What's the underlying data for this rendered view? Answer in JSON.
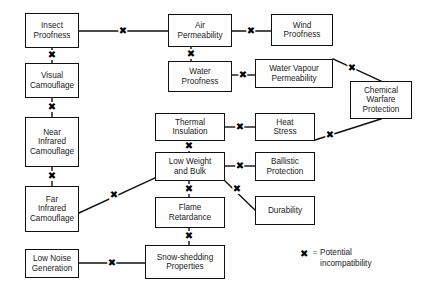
{
  "diagram": {
    "background_color": "#ffffff",
    "line_color": "#111111",
    "text_color": "#1a1a1a",
    "nodes": [
      {
        "id": "insect_proofness",
        "label": "Insect\nProofness",
        "x": 25,
        "y": 13,
        "w": 54,
        "h": 35
      },
      {
        "id": "visual_camouflage",
        "label": "Visual\nCamouflage",
        "x": 25,
        "y": 63,
        "w": 54,
        "h": 35
      },
      {
        "id": "near_infrared",
        "label": "Near\nInfrared\nCamouflage",
        "x": 25,
        "y": 117,
        "w": 54,
        "h": 50
      },
      {
        "id": "far_infrared",
        "label": "Far\nInfrared\nCamouflage",
        "x": 25,
        "y": 186,
        "w": 54,
        "h": 46
      },
      {
        "id": "low_noise",
        "label": "Low Noise\nGeneration",
        "x": 25,
        "y": 249,
        "w": 54,
        "h": 29
      },
      {
        "id": "air_permeability",
        "label": "Air\nPermeability",
        "x": 168,
        "y": 14,
        "w": 64,
        "h": 33
      },
      {
        "id": "water_proofness",
        "label": "Water\nProofness",
        "x": 168,
        "y": 61,
        "w": 64,
        "h": 31
      },
      {
        "id": "thermal_insulation",
        "label": "Thermal\nInsulation",
        "x": 155,
        "y": 113,
        "w": 70,
        "h": 28
      },
      {
        "id": "low_weight_and_bulk",
        "label": "Low Weight\nand Bulk",
        "x": 155,
        "y": 152,
        "w": 70,
        "h": 29
      },
      {
        "id": "flame_retardance",
        "label": "Flame\nRetardance",
        "x": 155,
        "y": 197,
        "w": 70,
        "h": 31
      },
      {
        "id": "snow_shedding",
        "label": "Snow-shedding\nProperties",
        "x": 145,
        "y": 245,
        "w": 80,
        "h": 34
      },
      {
        "id": "wind_proofness",
        "label": "Wind\nProofness",
        "x": 271,
        "y": 14,
        "w": 62,
        "h": 32
      },
      {
        "id": "water_vapour",
        "label": "Water Vapour\nPermeability",
        "x": 255,
        "y": 59,
        "w": 78,
        "h": 29
      },
      {
        "id": "heat_stress",
        "label": "Heat\nStress",
        "x": 255,
        "y": 113,
        "w": 60,
        "h": 28
      },
      {
        "id": "ballistic_protection",
        "label": "Ballistic\nProtection",
        "x": 255,
        "y": 152,
        "w": 60,
        "h": 29
      },
      {
        "id": "durability",
        "label": "Durability",
        "x": 255,
        "y": 196,
        "w": 60,
        "h": 29
      },
      {
        "id": "chemical_warfare",
        "label": "Chemical\nWarfare\nProtection",
        "x": 350,
        "y": 81,
        "w": 62,
        "h": 38
      }
    ],
    "edges": [
      {
        "id": "e1",
        "from": "insect_proofness",
        "to": "air_permeability",
        "x1": 79,
        "y1": 31,
        "x2": 168,
        "y2": 31
      },
      {
        "id": "e2",
        "from": "insect_proofness",
        "to": "visual_camouflage",
        "x1": 52,
        "y1": 48,
        "x2": 52,
        "y2": 63
      },
      {
        "id": "e3",
        "from": "visual_camouflage",
        "to": "near_infrared",
        "x1": 52,
        "y1": 98,
        "x2": 52,
        "y2": 117
      },
      {
        "id": "e4",
        "from": "near_infrared",
        "to": "far_infrared",
        "x1": 52,
        "y1": 167,
        "x2": 52,
        "y2": 186
      },
      {
        "id": "e5",
        "from": "far_infrared",
        "to": "low_weight_and_bulk",
        "x1": 79,
        "y1": 213,
        "x2": 155,
        "y2": 178
      },
      {
        "id": "e6",
        "from": "air_permeability",
        "to": "wind_proofness",
        "x1": 232,
        "y1": 31,
        "x2": 271,
        "y2": 31
      },
      {
        "id": "e7",
        "from": "air_permeability",
        "to": "water_proofness",
        "x1": 191,
        "y1": 47,
        "x2": 191,
        "y2": 61
      },
      {
        "id": "e8",
        "from": "water_proofness",
        "to": "water_vapour",
        "x1": 232,
        "y1": 75,
        "x2": 255,
        "y2": 75
      },
      {
        "id": "e9",
        "from": "water_vapour",
        "to": "chemical_warfare",
        "x1": 333,
        "y1": 59,
        "x2": 381,
        "y2": 81
      },
      {
        "id": "e10",
        "from": "heat_stress",
        "to": "chemical_warfare",
        "x1": 315,
        "y1": 140,
        "x2": 381,
        "y2": 119
      },
      {
        "id": "e11",
        "from": "thermal_insulation",
        "to": "heat_stress",
        "x1": 225,
        "y1": 127,
        "x2": 255,
        "y2": 127
      },
      {
        "id": "e12",
        "from": "thermal_insulation",
        "to": "low_weight_and_bulk",
        "x1": 189,
        "y1": 141,
        "x2": 189,
        "y2": 152
      },
      {
        "id": "e13",
        "from": "low_weight_and_bulk",
        "to": "ballistic_protection",
        "x1": 225,
        "y1": 166,
        "x2": 255,
        "y2": 166
      },
      {
        "id": "e14",
        "from": "low_weight_and_bulk",
        "to": "durability",
        "x1": 225,
        "y1": 181,
        "x2": 255,
        "y2": 210
      },
      {
        "id": "e15",
        "from": "low_weight_and_bulk",
        "to": "flame_retardance",
        "x1": 189,
        "y1": 181,
        "x2": 189,
        "y2": 197
      },
      {
        "id": "e16",
        "from": "flame_retardance",
        "to": "snow_shedding",
        "x1": 189,
        "y1": 228,
        "x2": 189,
        "y2": 245
      },
      {
        "id": "e17",
        "from": "low_noise",
        "to": "snow_shedding",
        "x1": 79,
        "y1": 263,
        "x2": 145,
        "y2": 263
      }
    ],
    "incompatibility_marks": [
      {
        "id": "m1",
        "edge": "e1",
        "x": 123,
        "y": 31
      },
      {
        "id": "m2",
        "edge": "e2",
        "x": 52,
        "y": 55
      },
      {
        "id": "m3",
        "edge": "e3",
        "x": 52,
        "y": 107
      },
      {
        "id": "m4",
        "edge": "e4",
        "x": 52,
        "y": 176
      },
      {
        "id": "m5",
        "edge": "e5",
        "x": 114,
        "y": 195
      },
      {
        "id": "m6",
        "edge": "e6",
        "x": 251,
        "y": 31
      },
      {
        "id": "m7",
        "edge": "e7",
        "x": 191,
        "y": 54
      },
      {
        "id": "m8",
        "edge": "e8",
        "x": 243,
        "y": 75
      },
      {
        "id": "m9",
        "edge": "e9",
        "x": 352,
        "y": 68
      },
      {
        "id": "m10",
        "edge": "e10",
        "x": 330,
        "y": 135
      },
      {
        "id": "m11",
        "edge": "e11",
        "x": 240,
        "y": 127
      },
      {
        "id": "m12",
        "edge": "e12",
        "x": 189,
        "y": 146
      },
      {
        "id": "m13",
        "edge": "e13",
        "x": 240,
        "y": 166
      },
      {
        "id": "m14",
        "edge": "e14",
        "x": 237,
        "y": 189
      },
      {
        "id": "m15",
        "edge": "e15",
        "x": 189,
        "y": 189
      },
      {
        "id": "m16",
        "edge": "e16",
        "x": 189,
        "y": 236
      },
      {
        "id": "m17",
        "edge": "e17",
        "x": 112,
        "y": 263
      }
    ],
    "mark_glyph": "✖",
    "legend": {
      "glyph": "✖",
      "equals": "=",
      "text": "Potential\nincompatibility"
    }
  }
}
